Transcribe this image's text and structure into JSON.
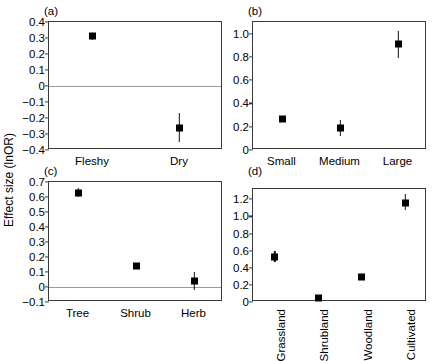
{
  "figure": {
    "ylabel": "Effect size (lnOR)"
  },
  "chart_data": [
    {
      "type": "scatter",
      "panel": "(a)",
      "title": "",
      "xlabel": "",
      "ylabel": "Effect size (lnOR)",
      "categories": [
        "Fleshy",
        "Dry"
      ],
      "values": [
        0.31,
        -0.26
      ],
      "err_low": [
        0.29,
        -0.35
      ],
      "err_high": [
        0.33,
        -0.17
      ],
      "ylim": [
        -0.4,
        0.4
      ],
      "yticks": [
        "0.4",
        "0.3",
        "0.2",
        "0.1",
        "0",
        "-0.1",
        "-0.2",
        "-0.3",
        "-0.4"
      ],
      "ytickvals": [
        0.4,
        0.3,
        0.2,
        0.1,
        0,
        -0.1,
        -0.2,
        -0.3,
        -0.4
      ],
      "zero_line": 0,
      "grid": false,
      "legend": "none"
    },
    {
      "type": "scatter",
      "panel": "(b)",
      "title": "",
      "xlabel": "",
      "ylabel": "Effect size (lnOR)",
      "categories": [
        "Small",
        "Medium",
        "Large"
      ],
      "values": [
        0.27,
        0.19,
        0.91
      ],
      "err_low": [
        0.25,
        0.12,
        0.79
      ],
      "err_high": [
        0.29,
        0.26,
        1.02
      ],
      "ylim": [
        0,
        1.1
      ],
      "yticks": [
        "1.0",
        "0.8",
        "0.6",
        "0.4",
        "0.2",
        "0"
      ],
      "ytickvals": [
        1.0,
        0.8,
        0.6,
        0.4,
        0.2,
        0
      ],
      "zero_line": null,
      "grid": false,
      "legend": "none"
    },
    {
      "type": "scatter",
      "panel": "(c)",
      "title": "",
      "xlabel": "",
      "ylabel": "Effect size (lnOR)",
      "categories": [
        "Tree",
        "Shrub",
        "Herb"
      ],
      "values": [
        0.63,
        0.14,
        0.04
      ],
      "err_low": [
        0.6,
        0.13,
        -0.02
      ],
      "err_high": [
        0.66,
        0.155,
        0.1
      ],
      "ylim": [
        -0.1,
        0.7
      ],
      "yticks": [
        "0.7",
        "0.6",
        "0.5",
        "0.4",
        "0.3",
        "0.2",
        "0.1",
        "0",
        "-0.1"
      ],
      "ytickvals": [
        0.7,
        0.6,
        0.5,
        0.4,
        0.3,
        0.2,
        0.1,
        0,
        -0.1
      ],
      "zero_line": 0,
      "grid": false,
      "legend": "none"
    },
    {
      "type": "scatter",
      "panel": "(d)",
      "title": "",
      "xlabel": "",
      "ylabel": "Effect size (lnOR)",
      "categories": [
        "Grassland",
        "Shrubland",
        "Woodland",
        "Cultivated"
      ],
      "values": [
        0.53,
        0.05,
        0.29,
        1.16
      ],
      "err_low": [
        0.47,
        0.04,
        0.28,
        1.07
      ],
      "err_high": [
        0.59,
        0.07,
        0.305,
        1.26
      ],
      "ylim": [
        0,
        1.32
      ],
      "yticks": [
        "1.2",
        "1.0",
        "0.8",
        "0.6",
        "0.4",
        "0.2",
        "0"
      ],
      "ytickvals": [
        1.2,
        1.0,
        0.8,
        0.6,
        0.4,
        0.2,
        0
      ],
      "zero_line": null,
      "grid": false,
      "legend": "none",
      "xtick_rotation": 90
    }
  ]
}
